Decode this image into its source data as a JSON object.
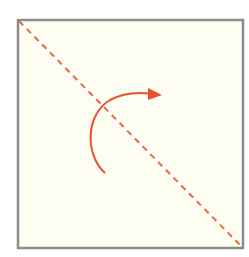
{
  "diagram": {
    "colors": {
      "background": "#ffffff",
      "square_fill": "#fefdf2",
      "square_border": "#8c8c8c",
      "fold_line": "#e8674a",
      "arrow": "#e8502f"
    },
    "square": {
      "x": 18,
      "y": 20,
      "width": 225,
      "height": 228
    },
    "fold_line": {
      "style": "dashed",
      "from": [
        18,
        20
      ],
      "to": [
        243,
        248
      ]
    },
    "arrow": {
      "type": "curved-rotation",
      "start": [
        105,
        173
      ],
      "end": [
        160,
        95
      ],
      "head": "arrowhead"
    }
  }
}
